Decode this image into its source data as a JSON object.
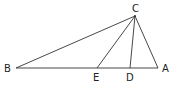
{
  "diagram": {
    "type": "geometry-triangle",
    "points": {
      "A": {
        "label": "A",
        "x": 158,
        "y": 68,
        "lx": 166,
        "ly": 72
      },
      "B": {
        "label": "B",
        "x": 16,
        "y": 68,
        "lx": 4,
        "ly": 72
      },
      "C": {
        "label": "C",
        "x": 135,
        "y": 16,
        "lx": 132,
        "ly": 12
      },
      "D": {
        "label": "D",
        "x": 130,
        "y": 68,
        "lx": 126,
        "ly": 81
      },
      "E": {
        "label": "E",
        "x": 97,
        "y": 68,
        "lx": 93,
        "ly": 81
      }
    },
    "segments": [
      [
        "B",
        "A"
      ],
      [
        "B",
        "C"
      ],
      [
        "C",
        "A"
      ],
      [
        "C",
        "E"
      ],
      [
        "C",
        "D"
      ]
    ],
    "colors": {
      "line": "#333333",
      "text": "#222222",
      "background": "#ffffff"
    }
  }
}
